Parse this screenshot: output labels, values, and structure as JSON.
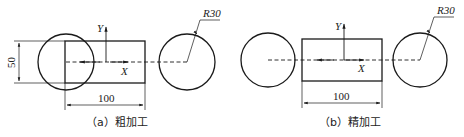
{
  "figures": [
    {
      "id": "a",
      "caption": "（a）粗加工",
      "radius_label": "R30",
      "width_dim": "100",
      "height_dim": "50",
      "axis_y": "Y",
      "axis_x": "X"
    },
    {
      "id": "b",
      "caption": "（b）精加工",
      "radius_label": "R30",
      "width_dim": "100",
      "axis_y": "Y",
      "axis_x": "X"
    }
  ],
  "colors": {
    "line": "#1a1a1a",
    "background": "#ffffff"
  }
}
